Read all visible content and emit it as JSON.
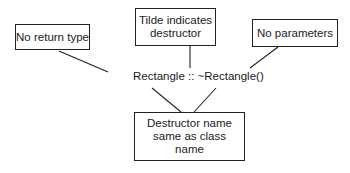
{
  "diagram": {
    "center_label": "Rectangle :: ~Rectangle()",
    "annotations": [
      {
        "id": "no-return-type",
        "text": "No return type"
      },
      {
        "id": "tilde",
        "text": "Tilde indicates\ndestructor"
      },
      {
        "id": "no-parameters",
        "text": "No parameters"
      },
      {
        "id": "same-name",
        "text": "Destructor name\nsame as class\nname"
      }
    ],
    "colors": {
      "line": "#222222",
      "text": "#1a1a1a",
      "background": "#ffffff"
    }
  }
}
